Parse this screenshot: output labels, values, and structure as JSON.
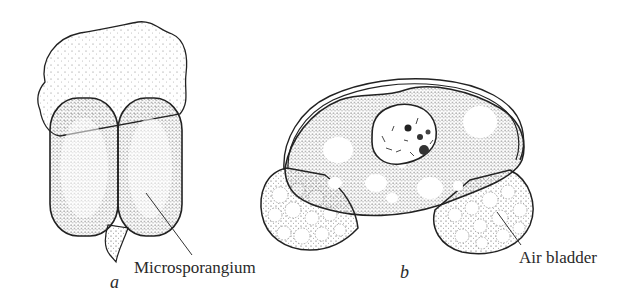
{
  "figure": {
    "panels": [
      {
        "id": "a",
        "label": "a",
        "callout": "Microsporangium"
      },
      {
        "id": "b",
        "label": "b",
        "callout": "Air bladder"
      }
    ]
  },
  "colors": {
    "ink": "#222222",
    "background": "#ffffff"
  }
}
